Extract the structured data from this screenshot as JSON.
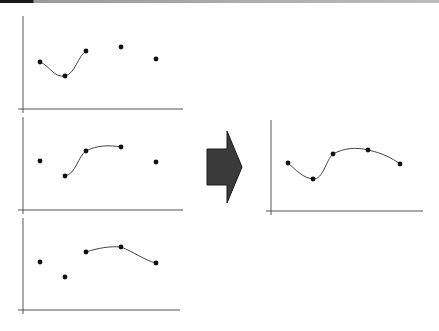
{
  "diagram": {
    "colors": {
      "axis": "#555555",
      "curve": "#444444",
      "point": "#111111",
      "arrow_fill": "#3a3a3a",
      "arrow_stroke": "#1a1a1a",
      "topbar_dark": "#1a1a1a",
      "topbar_light": "#bdbdbd"
    },
    "panels": [
      {
        "id": "segment-1",
        "points": [
          [
            40,
            62
          ],
          [
            65,
            76
          ],
          [
            86,
            51
          ],
          [
            121,
            47
          ],
          [
            156,
            59
          ]
        ],
        "curve_indices": [
          0,
          1,
          2
        ]
      },
      {
        "id": "segment-2",
        "points": [
          [
            40,
            161
          ],
          [
            65,
            176
          ],
          [
            86,
            151
          ],
          [
            121,
            147
          ],
          [
            156,
            162
          ]
        ],
        "curve_indices": [
          1,
          2,
          3
        ]
      },
      {
        "id": "segment-3",
        "points": [
          [
            40,
            262
          ],
          [
            65,
            277
          ],
          [
            86,
            252
          ],
          [
            121,
            247
          ],
          [
            156,
            263
          ]
        ],
        "curve_indices": [
          2,
          3,
          4
        ]
      }
    ],
    "result": {
      "id": "combined-curve",
      "points": [
        [
          288,
          163
        ],
        [
          313,
          179
        ],
        [
          333,
          154
        ],
        [
          368,
          150
        ],
        [
          400,
          164
        ]
      ]
    },
    "arrow": {
      "direction": "right"
    }
  }
}
